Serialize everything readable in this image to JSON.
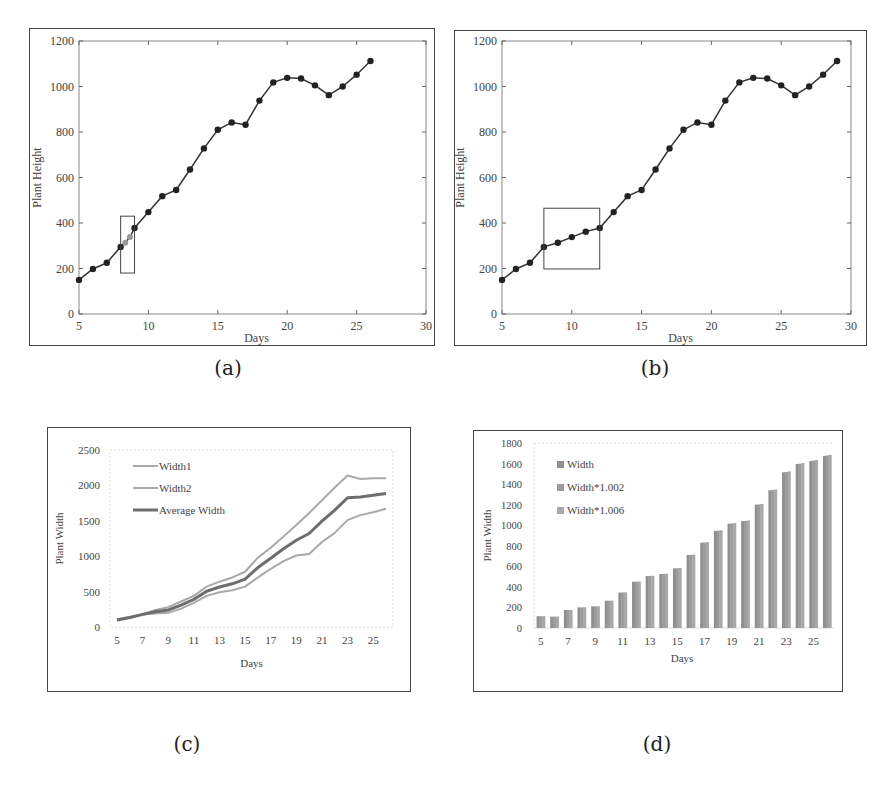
{
  "captions": {
    "a": "(a)",
    "b": "(b)",
    "c": "(c)",
    "d": "(d)"
  },
  "chart_data": [
    {
      "id": "a",
      "type": "line",
      "title": "",
      "xlabel": "Days",
      "ylabel": "Plant Height",
      "xlim": [
        5,
        30
      ],
      "ylim": [
        0,
        1200
      ],
      "xticks": [
        5,
        10,
        15,
        20,
        25,
        30
      ],
      "yticks": [
        0,
        200,
        400,
        600,
        800,
        1000,
        1200
      ],
      "grid": false,
      "x": [
        5,
        6,
        7,
        8,
        9,
        10,
        11,
        12,
        13,
        14,
        15,
        16,
        17,
        18,
        19,
        20,
        21,
        22,
        23,
        24,
        25,
        26
      ],
      "values": [
        150,
        198,
        225,
        295,
        378,
        448,
        518,
        545,
        635,
        728,
        810,
        842,
        832,
        938,
        1018,
        1038,
        1035,
        1005,
        962,
        1000,
        1052,
        1112
      ],
      "interpolated_points": {
        "x": [
          8.33,
          8.67
        ],
        "values": [
          313,
          338
        ],
        "note": "grey interpolated markers inside highlight box"
      },
      "annotation_box": {
        "x0": 8,
        "x1": 9,
        "y0": 180,
        "y1": 430
      }
    },
    {
      "id": "b",
      "type": "line",
      "title": "",
      "xlabel": "Days",
      "ylabel": "Plant Height",
      "xlim": [
        5,
        30
      ],
      "ylim": [
        0,
        1200
      ],
      "xticks": [
        5,
        10,
        15,
        20,
        25,
        30
      ],
      "yticks": [
        0,
        200,
        400,
        600,
        800,
        1000,
        1200
      ],
      "grid": false,
      "x": [
        5,
        6,
        7,
        8,
        9,
        10,
        11,
        12,
        13,
        14,
        15,
        16,
        17,
        18,
        19,
        20,
        21,
        22,
        23,
        24,
        25,
        26,
        27,
        28,
        29
      ],
      "values": [
        150,
        198,
        225,
        295,
        313,
        338,
        362,
        378,
        448,
        518,
        545,
        635,
        728,
        810,
        842,
        832,
        938,
        1018,
        1038,
        1035,
        1005,
        962,
        1000,
        1052,
        1112
      ],
      "annotation_box": {
        "x0": 8,
        "x1": 12,
        "y0": 198,
        "y1": 465
      }
    },
    {
      "id": "c",
      "type": "line",
      "title": "",
      "xlabel": "Days",
      "ylabel": "Plant Width",
      "ylim": [
        0,
        2500
      ],
      "yticks": [
        0,
        500,
        1000,
        1500,
        2000,
        2500
      ],
      "xtick_labels": [
        "5",
        "7",
        "9",
        "11",
        "13",
        "15",
        "17",
        "19",
        "21",
        "23",
        "25"
      ],
      "grid": false,
      "legend_position": "upper-left-inside",
      "categories": [
        5,
        6,
        7,
        8,
        9,
        10,
        11,
        12,
        13,
        14,
        15,
        16,
        17,
        18,
        19,
        20,
        21,
        22,
        23,
        24,
        25,
        26
      ],
      "series": [
        {
          "name": "Width1",
          "color": "#a9a9a9",
          "width": 2,
          "values": [
            90,
            130,
            180,
            240,
            280,
            360,
            440,
            570,
            640,
            700,
            780,
            980,
            1120,
            1280,
            1440,
            1610,
            1790,
            1970,
            2140,
            2090,
            2100,
            2100
          ]
        },
        {
          "name": "Width2",
          "color": "#a9a9a9",
          "width": 2,
          "values": [
            110,
            140,
            175,
            190,
            200,
            260,
            340,
            440,
            490,
            520,
            570,
            700,
            820,
            930,
            1010,
            1030,
            1200,
            1330,
            1510,
            1580,
            1620,
            1670
          ]
        },
        {
          "name": "Average Width",
          "color": "#6e6e6e",
          "width": 3,
          "values": [
            100,
            135,
            178,
            215,
            240,
            310,
            390,
            505,
            565,
            610,
            675,
            840,
            970,
            1105,
            1225,
            1320,
            1495,
            1650,
            1825,
            1835,
            1860,
            1885
          ]
        }
      ]
    },
    {
      "id": "d",
      "type": "bar",
      "title": "",
      "xlabel": "Days",
      "ylabel": "Plant Width",
      "ylim": [
        0,
        1800
      ],
      "yticks": [
        0,
        200,
        400,
        600,
        800,
        1000,
        1200,
        1400,
        1600,
        1800
      ],
      "xtick_labels": [
        "5",
        "7",
        "9",
        "11",
        "13",
        "15",
        "17",
        "19",
        "21",
        "23",
        "25"
      ],
      "grid": false,
      "legend_position": "upper-left-inside",
      "categories": [
        5,
        6,
        7,
        8,
        9,
        10,
        11,
        12,
        13,
        14,
        15,
        16,
        17,
        18,
        19,
        20,
        21,
        22,
        23,
        24,
        25,
        26
      ],
      "series": [
        {
          "name": "Width",
          "color": "#8f8f8f",
          "values": [
            115,
            110,
            175,
            200,
            210,
            265,
            345,
            450,
            505,
            525,
            580,
            710,
            830,
            945,
            1015,
            1040,
            1200,
            1340,
            1515,
            1595,
            1625,
            1675
          ]
        },
        {
          "name": "Width*1.002",
          "color": "#9c9c9c",
          "values": [
            115.2,
            110.2,
            175.4,
            200.4,
            210.4,
            265.5,
            345.7,
            450.9,
            506.0,
            526.1,
            581.2,
            711.4,
            831.7,
            946.9,
            1017.0,
            1042.1,
            1202.4,
            1342.7,
            1518.0,
            1598.2,
            1628.3,
            1678.4
          ]
        },
        {
          "name": "Width*1.006",
          "color": "#a8a8a8",
          "values": [
            115.7,
            110.7,
            176.1,
            201.2,
            211.3,
            266.6,
            347.1,
            452.7,
            508.0,
            528.2,
            583.5,
            714.3,
            835.0,
            950.7,
            1021.1,
            1046.2,
            1207.2,
            1348.0,
            1524.1,
            1604.6,
            1634.8,
            1685.1
          ]
        }
      ]
    }
  ]
}
